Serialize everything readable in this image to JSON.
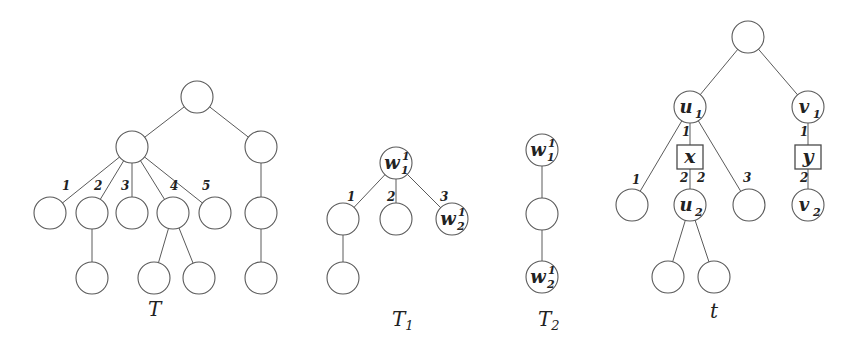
{
  "colors": {
    "stroke": "#5a5a5a",
    "text": "#222222",
    "background": "#ffffff"
  },
  "node_radius": 16,
  "trees": [
    {
      "id": "T",
      "title": {
        "main": "T",
        "sub": "",
        "x": 148,
        "y": 316
      },
      "nodes": [
        {
          "id": "r",
          "x": 197,
          "y": 97
        },
        {
          "id": "a",
          "x": 132,
          "y": 147
        },
        {
          "id": "b",
          "x": 261,
          "y": 147
        },
        {
          "id": "c1",
          "x": 50,
          "y": 213
        },
        {
          "id": "c2",
          "x": 92,
          "y": 213
        },
        {
          "id": "c3",
          "x": 132,
          "y": 213
        },
        {
          "id": "c4",
          "x": 173,
          "y": 213
        },
        {
          "id": "c5",
          "x": 215,
          "y": 213
        },
        {
          "id": "b1",
          "x": 261,
          "y": 213
        },
        {
          "id": "d2",
          "x": 92,
          "y": 278
        },
        {
          "id": "d4a",
          "x": 154,
          "y": 278
        },
        {
          "id": "d4b",
          "x": 199,
          "y": 278
        },
        {
          "id": "b2",
          "x": 261,
          "y": 278
        }
      ],
      "edges": [
        [
          "r",
          "a"
        ],
        [
          "r",
          "b"
        ],
        [
          "a",
          "c1"
        ],
        [
          "a",
          "c2"
        ],
        [
          "a",
          "c3"
        ],
        [
          "a",
          "c4"
        ],
        [
          "a",
          "c5"
        ],
        [
          "b",
          "b1"
        ],
        [
          "c2",
          "d2"
        ],
        [
          "c4",
          "d4a"
        ],
        [
          "c4",
          "d4b"
        ],
        [
          "b1",
          "b2"
        ]
      ],
      "edge_labels": [
        {
          "text": "1",
          "x": 62,
          "y": 190
        },
        {
          "text": "2",
          "x": 94,
          "y": 190
        },
        {
          "text": "3",
          "x": 121,
          "y": 190
        },
        {
          "text": "4",
          "x": 170,
          "y": 190
        },
        {
          "text": "5",
          "x": 202,
          "y": 190
        }
      ]
    },
    {
      "id": "T1",
      "title": {
        "main": "T",
        "sub": "1",
        "x": 392,
        "y": 326
      },
      "nodes": [
        {
          "id": "w1",
          "x": 396,
          "y": 163,
          "label": "w",
          "sup": "1",
          "sub": "1"
        },
        {
          "id": "p1",
          "x": 343,
          "y": 219
        },
        {
          "id": "p2",
          "x": 396,
          "y": 219
        },
        {
          "id": "w2",
          "x": 452,
          "y": 219,
          "label": "w",
          "sup": "1",
          "sub": "2"
        },
        {
          "id": "p3",
          "x": 343,
          "y": 278
        }
      ],
      "edges": [
        [
          "w1",
          "p1"
        ],
        [
          "w1",
          "p2"
        ],
        [
          "w1",
          "w2"
        ],
        [
          "p1",
          "p3"
        ]
      ],
      "edge_labels": [
        {
          "text": "1",
          "x": 347,
          "y": 201
        },
        {
          "text": "2",
          "x": 387,
          "y": 201
        },
        {
          "text": "3",
          "x": 440,
          "y": 201
        }
      ]
    },
    {
      "id": "T2",
      "title": {
        "main": "T",
        "sub": "2",
        "x": 538,
        "y": 326
      },
      "nodes": [
        {
          "id": "w1",
          "x": 542,
          "y": 150,
          "label": "w",
          "sup": "1",
          "sub": "1"
        },
        {
          "id": "m",
          "x": 542,
          "y": 214
        },
        {
          "id": "w2",
          "x": 542,
          "y": 277,
          "label": "w",
          "sup": "1",
          "sub": "2"
        }
      ],
      "edges": [
        [
          "w1",
          "m"
        ],
        [
          "m",
          "w2"
        ]
      ],
      "edge_labels": []
    },
    {
      "id": "t",
      "title": {
        "main": "t",
        "sub": "",
        "x": 710,
        "y": 318
      },
      "nodes": [
        {
          "id": "root",
          "x": 748,
          "y": 37
        },
        {
          "id": "u1",
          "x": 690,
          "y": 107,
          "label": "u",
          "sub": "1"
        },
        {
          "id": "v1",
          "x": 808,
          "y": 107,
          "label": "v",
          "sub": "1"
        },
        {
          "id": "x",
          "x": 690,
          "y": 157,
          "shape": "box",
          "label": "x"
        },
        {
          "id": "y",
          "x": 808,
          "y": 157,
          "shape": "box",
          "label": "y"
        },
        {
          "id": "l1",
          "x": 632,
          "y": 205
        },
        {
          "id": "u2",
          "x": 690,
          "y": 205,
          "label": "u",
          "sub": "2"
        },
        {
          "id": "l3",
          "x": 749,
          "y": 205
        },
        {
          "id": "v2",
          "x": 808,
          "y": 205,
          "label": "v",
          "sub": "2"
        },
        {
          "id": "g1",
          "x": 668,
          "y": 277
        },
        {
          "id": "g2",
          "x": 714,
          "y": 277
        }
      ],
      "edges": [
        [
          "root",
          "u1"
        ],
        [
          "root",
          "v1"
        ],
        [
          "u1",
          "l1"
        ],
        [
          "u1",
          "x"
        ],
        [
          "u1",
          "l3"
        ],
        [
          "x",
          "u2"
        ],
        [
          "v1",
          "y"
        ],
        [
          "y",
          "v2"
        ],
        [
          "u2",
          "g1"
        ],
        [
          "u2",
          "g2"
        ]
      ],
      "edge_labels": [
        {
          "text": "1",
          "x": 682,
          "y": 136
        },
        {
          "text": "1",
          "x": 632,
          "y": 184
        },
        {
          "text": "2",
          "x": 680,
          "y": 182
        },
        {
          "text": "2",
          "x": 697,
          "y": 182
        },
        {
          "text": "3",
          "x": 743,
          "y": 182
        },
        {
          "text": "1",
          "x": 800,
          "y": 136
        },
        {
          "text": "2",
          "x": 800,
          "y": 182
        }
      ]
    }
  ]
}
